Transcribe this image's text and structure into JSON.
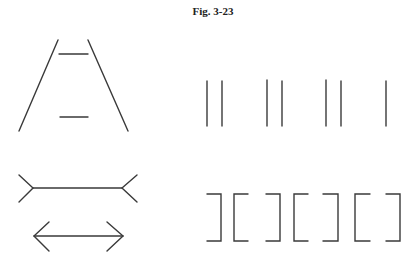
{
  "figure": {
    "title": "Fig. 3-23",
    "panels": [
      {
        "id": "ponzo",
        "description": "Two equal horizontal bars between converging lines"
      },
      {
        "id": "parallel-lines",
        "description": "Vertical lines in pairs with different spacing",
        "line_count": 7
      },
      {
        "id": "muller-lyer",
        "description": "Two equal shafts with outward and inward fins"
      },
      {
        "id": "brackets",
        "description": "Alternating bracket shapes",
        "bracket_count": 7
      }
    ],
    "colors": {
      "stroke": "#3a3a3a",
      "background": "#ffffff"
    }
  }
}
